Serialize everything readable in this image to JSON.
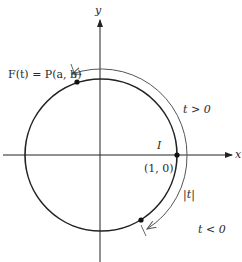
{
  "diagram": {
    "type": "unit-circle-wrapping-function",
    "axes": {
      "x_label": "x",
      "y_label": "y"
    },
    "labels": {
      "point_label": "F(t) = P(a, b)",
      "origin_point_letter": "I",
      "origin_point_coords": "(1, 0)",
      "t_positive": "t > 0",
      "t_negative": "t < 0",
      "abs_t": "|t|"
    },
    "colors": {
      "line": "#222222",
      "arc": "#555555",
      "text": "#2a2a2a"
    }
  }
}
